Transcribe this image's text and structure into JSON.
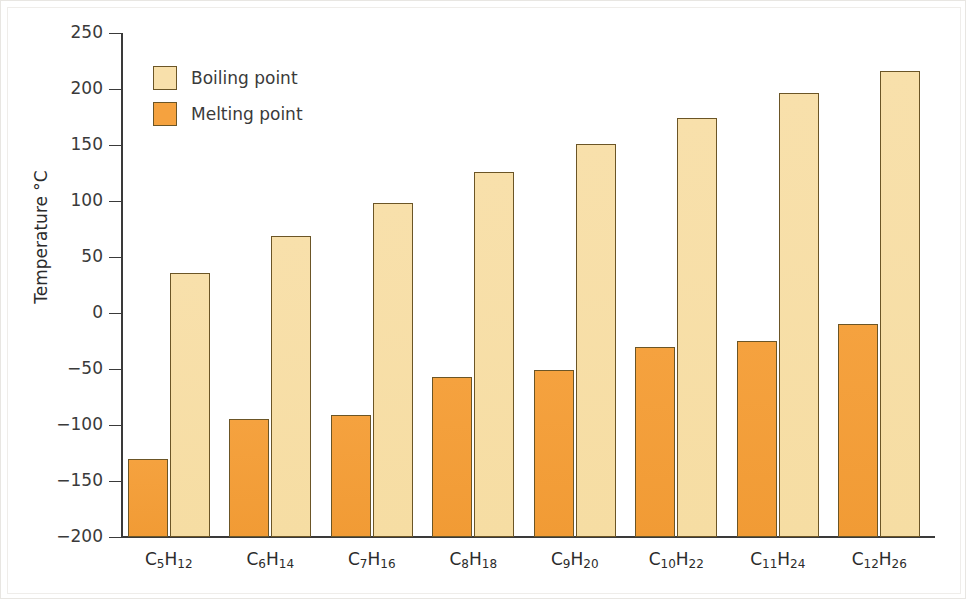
{
  "chart_data": {
    "type": "bar",
    "title": "",
    "xlabel": "",
    "ylabel": "Temperature °C",
    "ylim": [
      -200,
      250
    ],
    "ytick_step": 50,
    "yticks": [
      250,
      200,
      150,
      100,
      50,
      0,
      -50,
      -100,
      -150,
      -200
    ],
    "ytick_labels": [
      "250",
      "200",
      "150",
      "100",
      "50",
      "0",
      "−50",
      "−100",
      "−150",
      "−200"
    ],
    "grid": false,
    "legend_position": "upper-left-inside",
    "categories": [
      "C5H12",
      "C6H14",
      "C7H16",
      "C8H18",
      "C9H20",
      "C10H22",
      "C11H24",
      "C12H26"
    ],
    "category_labels": [
      {
        "element": "C",
        "carbon": "5",
        "hydrogen_element": "H",
        "hydrogen": "12"
      },
      {
        "element": "C",
        "carbon": "6",
        "hydrogen_element": "H",
        "hydrogen": "14"
      },
      {
        "element": "C",
        "carbon": "7",
        "hydrogen_element": "H",
        "hydrogen": "16"
      },
      {
        "element": "C",
        "carbon": "8",
        "hydrogen_element": "H",
        "hydrogen": "18"
      },
      {
        "element": "C",
        "carbon": "9",
        "hydrogen_element": "H",
        "hydrogen": "20"
      },
      {
        "element": "C",
        "carbon": "10",
        "hydrogen_element": "H",
        "hydrogen": "22"
      },
      {
        "element": "C",
        "carbon": "11",
        "hydrogen_element": "H",
        "hydrogen": "24"
      },
      {
        "element": "C",
        "carbon": "12",
        "hydrogen_element": "H",
        "hydrogen": "26"
      }
    ],
    "series": [
      {
        "name": "Melting point",
        "key": "melting",
        "color": "#f5a23f",
        "values": [
          -130,
          -95,
          -91,
          -57,
          -51,
          -30,
          -25,
          -10
        ]
      },
      {
        "name": "Boiling point",
        "key": "boiling",
        "color": "#f8e0ab",
        "values": [
          36,
          69,
          98,
          126,
          151,
          174,
          196,
          216
        ]
      }
    ],
    "series_draw_order": [
      "melting",
      "boiling"
    ],
    "bar_edge_color": "#6b5526",
    "axis_color": "#3a3a3a"
  },
  "legend": {
    "items": [
      {
        "label": "Boiling point",
        "swatch": "boiling"
      },
      {
        "label": "Melting point",
        "swatch": "melting"
      }
    ]
  }
}
